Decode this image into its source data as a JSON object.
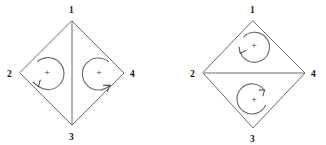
{
  "figure": {
    "width": 326,
    "height": 145,
    "background_color": "#ffffff",
    "line_color": "#6b6b6b",
    "label_color": "#1a1a1a",
    "plus_symbol": "+"
  },
  "diagrams": [
    {
      "id": "left-quadrilateral",
      "diagonal_orientation": "vertical",
      "diagonal_from": "1",
      "diagonal_to": "3",
      "vertices": [
        {
          "label": "1",
          "position": "top",
          "x": 72,
          "y": 21,
          "label_x": 69,
          "label_y": 13
        },
        {
          "label": "2",
          "position": "left",
          "x": 20,
          "y": 73,
          "label_x": 7,
          "label_y": 77
        },
        {
          "label": "4",
          "position": "right",
          "x": 124,
          "y": 73,
          "label_x": 130,
          "label_y": 77
        },
        {
          "label": "3",
          "position": "bottom",
          "x": 72,
          "y": 125,
          "label_x": 69,
          "label_y": 140
        }
      ],
      "rotation_arcs": [
        {
          "id": "left-arc",
          "sign": "+",
          "center_x": 47,
          "center_y": 74,
          "radius": 16,
          "direction": "counterclockwise",
          "opening": "left",
          "plus_x": 47,
          "plus_y": 74
        },
        {
          "id": "right-arc",
          "sign": "+",
          "center_x": 99,
          "center_y": 74,
          "radius": 16,
          "direction": "counterclockwise",
          "opening": "right",
          "plus_x": 99,
          "plus_y": 74
        }
      ]
    },
    {
      "id": "right-quadrilateral",
      "diagonal_orientation": "horizontal",
      "diagonal_from": "2",
      "diagonal_to": "4",
      "vertices": [
        {
          "label": "1",
          "position": "top",
          "x": 253,
          "y": 21,
          "label_x": 250,
          "label_y": 13
        },
        {
          "label": "2",
          "position": "left",
          "x": 203,
          "y": 73,
          "label_x": 190,
          "label_y": 77
        },
        {
          "label": "4",
          "position": "right",
          "x": 305,
          "y": 73,
          "label_x": 311,
          "label_y": 77
        },
        {
          "label": "3",
          "position": "bottom",
          "x": 253,
          "y": 128,
          "label_x": 250,
          "label_y": 142
        }
      ],
      "rotation_arcs": [
        {
          "id": "top-arc",
          "sign": "+",
          "center_x": 254,
          "center_y": 47,
          "radius": 15,
          "direction": "counterclockwise",
          "opening": "top-left",
          "plus_x": 254,
          "plus_y": 47
        },
        {
          "id": "bottom-arc",
          "sign": "+",
          "center_x": 254,
          "center_y": 101,
          "radius": 15,
          "direction": "counterclockwise",
          "opening": "top",
          "plus_x": 254,
          "plus_y": 101
        }
      ]
    }
  ]
}
